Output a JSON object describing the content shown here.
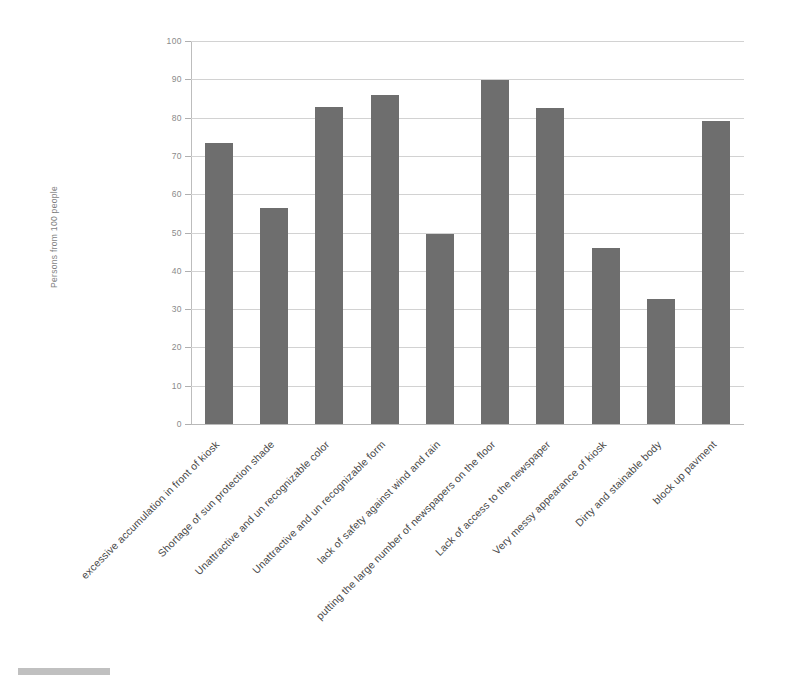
{
  "chart_data": {
    "type": "bar",
    "title": "",
    "xlabel": "",
    "ylabel": "Persons from 100 people",
    "ylim": [
      0,
      100
    ],
    "ytick_step": 10,
    "grid": true,
    "legend": "none",
    "bar_color": "#6e6e6e",
    "gridline_color": "#d2d2d2",
    "label_rotation_deg": -45,
    "yticks": [
      "0",
      "10",
      "20",
      "30",
      "40",
      "50",
      "60",
      "70",
      "80",
      "90",
      "100"
    ],
    "categories": [
      "excessive accumulation in front of kiosk",
      "Shortage of sun protection shade",
      "Unattractive and un recognizable color",
      "Unattractive and un recognizable form",
      "lack of safety against wind and rain",
      "putting the large number of newspapers on the floor",
      "Lack of access to the newspaper",
      "Very messy appearance of  kiosk",
      "Dirty and stainable body",
      "block up pavment"
    ],
    "values": [
      73.3,
      56.3,
      82.8,
      86.0,
      49.5,
      89.7,
      82.6,
      46.0,
      32.6,
      79.0
    ]
  }
}
